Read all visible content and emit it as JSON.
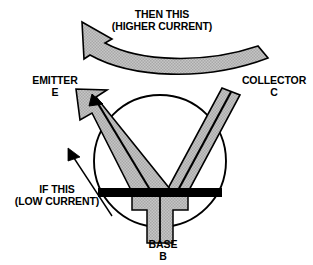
{
  "diagram": {
    "colors": {
      "fill_gray": "#bfbfbf",
      "outline_black": "#000000",
      "background": "#ffffff",
      "base_bar_black": "#000000"
    },
    "labels": {
      "then_this": {
        "line1": "THEN THIS",
        "line2": "(HIGHER CURRENT)"
      },
      "emitter": {
        "line1": "EMITTER",
        "line2": "E"
      },
      "collector": {
        "line1": "COLLECTOR",
        "line2": "C"
      },
      "if_this": {
        "line1": "IF THIS",
        "line2": "(LOW CURRENT)"
      },
      "base": {
        "line1": "BASE",
        "line2": "B"
      }
    },
    "shapes": {
      "circle": {
        "cx": 160,
        "cy": 161,
        "r": 66,
        "stroke": "#000000",
        "stroke_width": 1.8,
        "fill": "none"
      },
      "base_bar": {
        "x": 98,
        "y": 188,
        "width": 124,
        "height": 9,
        "fill": "#000000"
      },
      "emitter_band": {
        "description": "gray band from base up-left ending in arrowhead",
        "arrowhead": true
      },
      "collector_band": {
        "description": "gray band from base up-right, plain angled end",
        "arrowhead": false
      },
      "base_stem": {
        "description": "gray T-shaped stem below base bar down to label"
      },
      "curved_arrow": {
        "description": "thick curved gray arrow across top pointing left",
        "direction": "left"
      },
      "pointer_arrow": {
        "description": "thin black line arrow pointing up-right toward emitter"
      }
    }
  }
}
